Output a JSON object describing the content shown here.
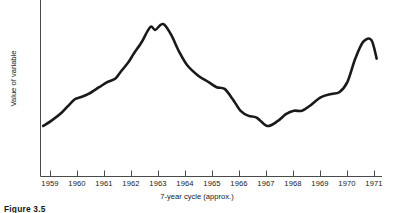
{
  "chart_data": {
    "type": "line",
    "title": "",
    "xlabel": "7-year cycle (approx.)",
    "ylabel": "Value of variable",
    "grid": false,
    "legend": "none",
    "xlim": [
      1958.5,
      1971.3
    ],
    "ylim": [
      0,
      100
    ],
    "tick_labels": [
      "1959",
      "1960",
      "1961",
      "1962",
      "1963",
      "1964",
      "1965",
      "1966",
      "1967",
      "1968",
      "1969",
      "1970",
      "1971"
    ],
    "series": [
      {
        "name": "Value of variable",
        "x": [
          1958.6,
          1958.9,
          1959.3,
          1959.6,
          1959.8,
          1960.0,
          1960.3,
          1960.7,
          1961.0,
          1961.3,
          1961.5,
          1961.8,
          1962.0,
          1962.3,
          1962.5,
          1962.65,
          1962.8,
          1963.0,
          1963.15,
          1963.4,
          1963.7,
          1964.0,
          1964.4,
          1964.8,
          1965.1,
          1965.4,
          1965.7,
          1966.0,
          1966.3,
          1966.6,
          1967.0,
          1967.4,
          1967.7,
          1968.0,
          1968.3,
          1968.6,
          1969.0,
          1969.4,
          1969.7,
          1970.0,
          1970.3,
          1970.6,
          1970.9,
          1971.1
        ],
        "y": [
          30,
          33,
          38,
          43,
          46,
          47,
          49,
          53,
          56,
          58,
          62,
          68,
          73,
          80,
          86,
          89,
          87,
          90,
          90,
          84,
          74,
          66,
          60,
          56,
          53,
          52,
          46,
          39,
          36,
          35,
          30,
          33,
          37,
          39,
          39,
          42,
          47,
          49,
          50,
          56,
          70,
          80,
          81,
          70
        ]
      }
    ]
  },
  "axes": {
    "y_axis_title": "Value of variable",
    "x_axis_title": "7-year cycle (approx.)",
    "ticks": [
      {
        "label": "1959",
        "x": 1959
      },
      {
        "label": "1960",
        "x": 1960
      },
      {
        "label": "1961",
        "x": 1961
      },
      {
        "label": "1962",
        "x": 1962
      },
      {
        "label": "1963",
        "x": 1963
      },
      {
        "label": "1964",
        "x": 1964
      },
      {
        "label": "1965",
        "x": 1965
      },
      {
        "label": "1966",
        "x": 1966
      },
      {
        "label": "1967",
        "x": 1967
      },
      {
        "label": "1968",
        "x": 1968
      },
      {
        "label": "1969",
        "x": 1969
      },
      {
        "label": "1970",
        "x": 1970
      },
      {
        "label": "1971",
        "x": 1971
      }
    ]
  },
  "caption": {
    "text": "Figure 3.5"
  },
  "colors": {
    "data_line": "#1a1a1a",
    "axis": "#4a4a4a",
    "text": "#16181a",
    "background": "#ffffff"
  }
}
